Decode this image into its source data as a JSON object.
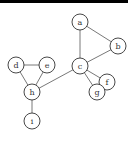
{
  "graph": {
    "nodes": [
      {
        "id": "a",
        "label": "a",
        "x": 80,
        "y": 22
      },
      {
        "id": "b",
        "label": "b",
        "x": 118,
        "y": 46
      },
      {
        "id": "c",
        "label": "c",
        "x": 80,
        "y": 66
      },
      {
        "id": "d",
        "label": "d",
        "x": 16,
        "y": 65
      },
      {
        "id": "e",
        "label": "e",
        "x": 47,
        "y": 65
      },
      {
        "id": "f",
        "label": "f",
        "x": 107,
        "y": 82
      },
      {
        "id": "g",
        "label": "g",
        "x": 97,
        "y": 92
      },
      {
        "id": "h",
        "label": "h",
        "x": 32,
        "y": 92
      },
      {
        "id": "i",
        "label": "i",
        "x": 32,
        "y": 121
      }
    ],
    "edges": [
      [
        "a",
        "b"
      ],
      [
        "a",
        "c"
      ],
      [
        "b",
        "c"
      ],
      [
        "c",
        "h"
      ],
      [
        "c",
        "f"
      ],
      [
        "c",
        "g"
      ],
      [
        "f",
        "g"
      ],
      [
        "d",
        "e"
      ],
      [
        "d",
        "h"
      ],
      [
        "e",
        "h"
      ],
      [
        "h",
        "i"
      ]
    ],
    "node_radius": 8
  }
}
